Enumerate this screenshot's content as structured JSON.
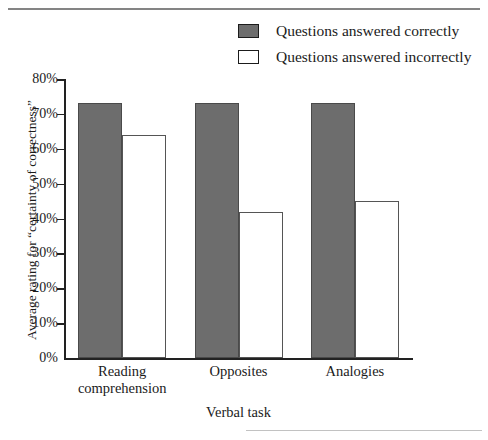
{
  "figure": {
    "background": "#ffffff",
    "fill_color": "#6d6d6d",
    "line_color": "#222222"
  },
  "legend": {
    "position": "top-right",
    "entries": [
      {
        "label": "Questions answered correctly",
        "swatch": "filled-square-icon",
        "color": "#6d6d6d"
      },
      {
        "label": "Questions answered incorrectly",
        "swatch": "hollow-square-icon",
        "color": "#ffffff"
      }
    ]
  },
  "axes": {
    "y_title": "Average rating for “certainty of correctness”",
    "x_title": "Verbal task",
    "y_ticks": [
      "80%",
      "70%",
      "60%",
      "50%",
      "40%",
      "30%",
      "20%",
      "10%",
      "0%"
    ]
  },
  "chart_data": {
    "type": "bar",
    "title": "",
    "subtitle": "",
    "xlabel": "Verbal task",
    "ylabel": "Average rating for “certainty of correctness”",
    "categories": [
      "Reading comprehension",
      "Opposites",
      "Analogies"
    ],
    "category_lines": [
      [
        "Reading",
        "comprehension"
      ],
      [
        "Opposites"
      ],
      [
        "Analogies"
      ]
    ],
    "series": [
      {
        "name": "Questions answered correctly",
        "color": "#6d6d6d",
        "values": [
          73,
          73,
          73
        ]
      },
      {
        "name": "Questions answered incorrectly",
        "color": "#ffffff",
        "values": [
          64,
          42,
          45
        ]
      }
    ],
    "ylim": [
      0,
      80
    ],
    "ytick_step": 10,
    "ytick_values": [
      80,
      70,
      60,
      50,
      40,
      30,
      20,
      10,
      0
    ],
    "ytick_labels": [
      "80%",
      "70%",
      "60%",
      "50%",
      "40%",
      "30%",
      "20%",
      "10%",
      "0%"
    ],
    "grid": false,
    "legend_position": "top-right",
    "value_unit": "percent"
  }
}
